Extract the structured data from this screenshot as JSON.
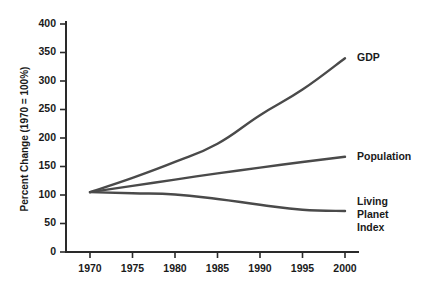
{
  "chart_data": {
    "type": "line",
    "title": "",
    "subtitle": "",
    "xlabel": "",
    "ylabel": "Percent Change (1970 = 100%)",
    "xlim": [
      1968,
      2002
    ],
    "ylim": [
      0,
      400
    ],
    "grid": false,
    "legend_position": "right-inline-labels",
    "x_ticks": [
      1970,
      1975,
      1980,
      1985,
      1990,
      1995,
      2000
    ],
    "x_tick_labels": [
      "1970",
      "1975",
      "1980",
      "1985",
      "1990",
      "1995",
      "2000"
    ],
    "y_ticks": [
      0,
      50,
      100,
      150,
      200,
      250,
      300,
      350,
      400
    ],
    "y_tick_labels": [
      "0",
      "50",
      "100",
      "150",
      "200",
      "250",
      "300",
      "350",
      "400"
    ],
    "x": [
      1970,
      1975,
      1980,
      1985,
      1990,
      1995,
      2000
    ],
    "series": [
      {
        "name": "GDP",
        "color": "#4a4a4a",
        "values": [
          105,
          130,
          158,
          190,
          240,
          285,
          340
        ],
        "label_value": "340"
      },
      {
        "name": "Population",
        "color": "#4a4a4a",
        "values": [
          105,
          116,
          127,
          138,
          148,
          158,
          167
        ],
        "label_value": "167"
      },
      {
        "name": "Living Planet Index",
        "color": "#4a4a4a",
        "values": [
          105,
          103,
          101,
          93,
          83,
          74,
          72
        ],
        "label_value": "72"
      }
    ],
    "series_labels": [
      {
        "name": "GDP",
        "lines": [
          "GDP"
        ]
      },
      {
        "name": "Population",
        "lines": [
          "Population"
        ]
      },
      {
        "name": "Living Planet Index",
        "lines": [
          "Living",
          "Planet",
          "Index"
        ]
      }
    ],
    "colors": {
      "line": "#4a4a4a",
      "axis": "#2a2a2a",
      "text": "#1a1a1a",
      "background": "#ffffff"
    }
  }
}
